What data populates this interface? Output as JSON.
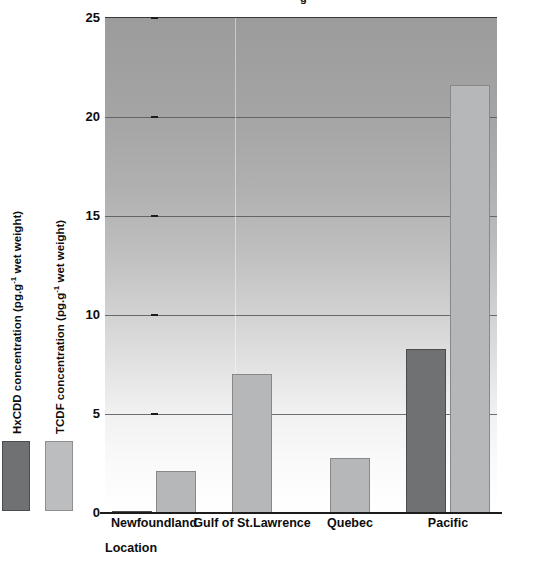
{
  "chart_data": {
    "type": "bar",
    "title": "",
    "xlabel": "Location",
    "categories": [
      "Newfoundland",
      "Gulf of St.Lawrence",
      "Quebec",
      "Pacific"
    ],
    "series": [
      {
        "name": "HxCDD concentration (pg.g-1 wet weight)",
        "values": [
          0.1,
          0,
          0,
          8.3
        ],
        "color": "#6f7173"
      },
      {
        "name": "TCDF concentration (pg.g-1 wet weight)",
        "values": [
          2.1,
          7.0,
          2.8,
          21.6
        ],
        "color": "#b6b7b8"
      }
    ],
    "ylim": [
      0,
      25
    ],
    "yticks": [
      0,
      5,
      10,
      15,
      20,
      25
    ],
    "ytick_labels": [
      "0",
      "5",
      "10",
      "15",
      "20",
      "25"
    ],
    "grid": "horizontal",
    "legend_position": "left-outside-vertical"
  },
  "axes": {
    "y_label_hx_prefix": "HxCDD concentration (pg.g",
    "y_label_hx_sup": "-1",
    "y_label_hx_suffix": " wet weight)",
    "y_label_tcdf_prefix": "TCDF concentration (pg.g",
    "y_label_tcdf_sup": "-1",
    "y_label_tcdf_suffix": " wet weight)",
    "x_title": "Location"
  },
  "legend": {
    "items": [
      {
        "label": "HxCDD concentration (pg.g-1 wet weight)",
        "color": "#6f7173"
      },
      {
        "label": "TCDF concentration (pg.g-1 wet weight)",
        "color": "#b6b7b8"
      }
    ]
  },
  "title_remnant": "g",
  "colors": {
    "bar_hx": "#6f7173",
    "bar_tcdf": "#b6b7b8",
    "gridline": "#55585a",
    "axis": "#1c1c1c",
    "text": "#0d0d0d",
    "plot_bg_top": "#9c9c9c",
    "plot_bg_bottom": "#ffffff"
  }
}
